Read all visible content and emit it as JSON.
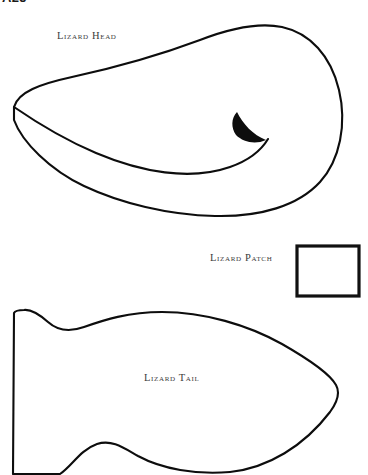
{
  "page": {
    "background_color": "#ffffff",
    "ink_color": "#0d0d0d",
    "label_color": "#3a3a3a",
    "width": 368,
    "height": 475,
    "heading_clipped": "A25"
  },
  "pieces": [
    {
      "id": "lizard-head",
      "label": "Lizard Head",
      "description": "large kidney / bean shaped head pattern piece with a curved crease line and a solid black wedge marking",
      "has_crease_line": true,
      "has_solid_marking": true
    },
    {
      "id": "lizard-patch",
      "label": "Lizard Patch",
      "description": "small rectangular pattern piece",
      "shape": "rectangle",
      "rect": {
        "x": 297,
        "y": 246,
        "width": 62,
        "height": 50
      }
    },
    {
      "id": "lizard-tail",
      "label": "Lizard Tail",
      "description": "wavy fish / dart shaped tail pattern piece with straight left edge and pointed right tip, cropped at bottom edge",
      "cropped_at_bottom": true
    }
  ],
  "geometry": {
    "head_outline": "M 14 107 C 18 92, 40 84, 72 77 C 118 67, 168 52, 200 40 C 231 28, 258 22, 282 27 C 310 33, 331 56, 339 90 C 347 124, 340 160, 320 182 C 298 206, 260 217, 215 216 C 168 215, 120 203, 84 186 C 50 170, 22 142, 14 120 Z",
    "head_crease": "M 14 107 C 30 118, 58 137, 96 153 C 141 172, 190 181, 230 167 C 250 160, 262 149, 268 139",
    "head_wedge": "M 268 139 C 258 130, 249 122, 240 114 C 247 133, 258 141, 268 139 Z",
    "head_wedge_alt": "M 237 112 C 243 124, 253 135, 266 140 C 255 145, 243 142, 236 135 C 231 128, 231 118, 237 112 Z",
    "tail_outline": "M 14 313 L 13 474 L 60 474 C 72 466, 80 450, 97 444 C 112 439, 124 448, 138 456 C 162 469, 196 475, 230 472 C 268 468, 304 446, 330 412 C 338 401, 340 392, 336 385 C 330 374, 310 360, 282 344 C 248 325, 204 312, 162 312 C 128 312, 104 320, 84 327 C 70 332, 58 331, 48 322 C 40 315, 32 309, 24 310 C 19 310, 15 311, 14 313 Z"
  }
}
